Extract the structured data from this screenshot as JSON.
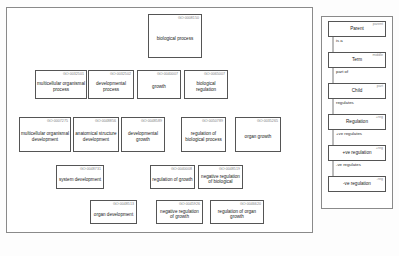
{
  "diagram": {
    "node_border_color": "#555555",
    "edge_color": "#1a1a1a",
    "panel_border_color": "#8a8a8a",
    "background_color": "#fdfdfd"
  },
  "nodes": [
    {
      "id": "GO:0008150",
      "label": "biological process"
    },
    {
      "id": "GO:0032501",
      "label": "multicellular organismal process"
    },
    {
      "id": "GO:0032502",
      "label": "developmental process"
    },
    {
      "id": "GO:0040007",
      "label": "growth"
    },
    {
      "id": "GO:0065007",
      "label": "biological regulation"
    },
    {
      "id": "GO:0007275",
      "label": "multicellular organismal development"
    },
    {
      "id": "GO:0048856",
      "label": "anatomical structure development"
    },
    {
      "id": "GO:0048589",
      "label": "developmental growth"
    },
    {
      "id": "GO:0050789",
      "label": "regulation of biological process"
    },
    {
      "id": "GO:0035265",
      "label": "organ growth"
    },
    {
      "id": "GO:0048731",
      "label": "system development"
    },
    {
      "id": "GO:0040008",
      "label": "regulation of growth"
    },
    {
      "id": "GO:0048519",
      "label": "negative regulation of biological"
    },
    {
      "id": "GO:0048513",
      "label": "organ development"
    },
    {
      "id": "GO:0045926",
      "label": "negative regulation of growth"
    },
    {
      "id": "GO:0046620",
      "label": "regulation of organ growth"
    }
  ],
  "legend": {
    "nodes": [
      {
        "tag": "parent",
        "name": "Parent"
      },
      {
        "tag": "middle",
        "name": "Term"
      },
      {
        "tag": "part",
        "name": "Child"
      },
      {
        "tag": "+reg",
        "name": "Regulation"
      },
      {
        "tag": "+reg",
        "name": "+ve regulation"
      },
      {
        "tag": "-reg",
        "name": "-ve regulation"
      }
    ],
    "edges": [
      {
        "label": "is a"
      },
      {
        "label": "part of"
      },
      {
        "label": "regulates"
      },
      {
        "label": "+ve regulates"
      },
      {
        "label": "-ve regulates"
      }
    ]
  }
}
